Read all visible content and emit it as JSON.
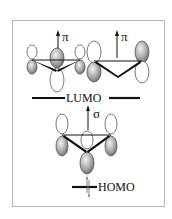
{
  "diagram": {
    "orbitals": [
      {
        "id": "pi-1",
        "symmetry": "π",
        "level": "LUMO",
        "description": "three-center π orbital (left)"
      },
      {
        "id": "pi-2",
        "symmetry": "π",
        "level": "LUMO",
        "description": "two-lobe π orbital (right)"
      },
      {
        "id": "sigma",
        "symmetry": "σ",
        "level": "above HOMO",
        "description": "three-center σ orbital"
      }
    ],
    "labels": {
      "pi_left": "π",
      "pi_right": "π",
      "lumo": "LUMO",
      "sigma": "σ",
      "homo": "HOMO"
    },
    "colors": {
      "frame": "#b8b8b8",
      "bond": "#111111",
      "lobe_shaded": "#9a9a9a",
      "lobe_outline": "#555555"
    }
  }
}
